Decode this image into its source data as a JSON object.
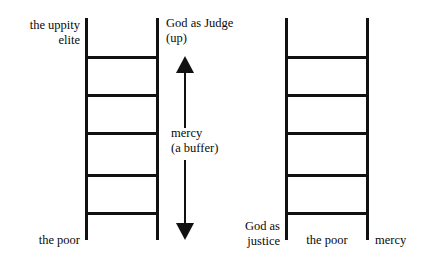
{
  "diagram": {
    "background_color": "#ffffff",
    "ink_color": "#111111",
    "labels": {
      "uppity_elite": "the uppity\nelite",
      "god_as_judge": "God as Judge\n(up)",
      "mercy_buffer": "mercy\n(a buffer)",
      "the_poor_left": "the poor",
      "god_as_justice": "God as\njustice",
      "the_poor_right": "the poor",
      "mercy_right": "mercy"
    },
    "ladders": [
      {
        "name": "left-ladder",
        "top_label": "the uppity elite",
        "bottom_label": "the poor",
        "rung_count": 5
      },
      {
        "name": "right-ladder",
        "left_label": "God as justice",
        "bottom_label": "the poor",
        "right_label": "mercy",
        "rung_count": 5
      }
    ],
    "arrows": [
      {
        "name": "up-arrow",
        "direction": "up",
        "meaning": "God as Judge (up)"
      },
      {
        "name": "down-arrow",
        "direction": "down",
        "meaning": "mercy (a buffer)"
      }
    ]
  }
}
